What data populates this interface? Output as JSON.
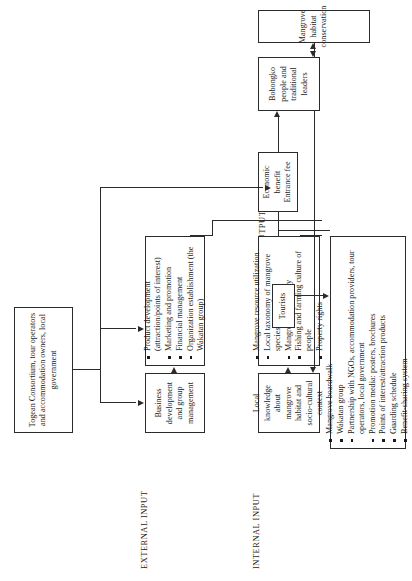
{
  "diagram": {
    "section_labels": {
      "external_input": "EXTERNAL INPUT",
      "internal_input": "INTERNAL INPUT",
      "output": "OUTPUT"
    },
    "nodes": {
      "consortium": {
        "name": "consortium-node",
        "text": "Togean Consortium, tour operators and accommodation owners, local government"
      },
      "business_development": {
        "name": "business-development-node",
        "text": "Business development and group management"
      },
      "external_activities": {
        "name": "external-activities-node",
        "items": [
          "Product development (attraction/points of interest)",
          "Marketing and promotion",
          "Financial management",
          "Organization establishment (the Wakatan group)"
        ]
      },
      "local_knowledge": {
        "name": "local-knowledge-node",
        "text": "Local knowledge about mangrove habitat and socio-cultural context"
      },
      "internal_resources": {
        "name": "internal-resources-node",
        "items": [
          "Mangrove resource utilization",
          "Local taxonomy of mangrove species",
          "Mangrove mythology",
          "Fishing and farming culture of people",
          "Property rights"
        ]
      },
      "outputs": {
        "name": "outputs-node",
        "items": [
          "Mangrove boardwalk",
          "Wakatan group",
          "Partnership with NGOs, accommodation providers, tour operators, local government",
          "Promotion media: posters, brochures",
          "Points of interest/attraction products",
          "Guarding schedule",
          "Benefit-sharing system"
        ]
      },
      "tourists": {
        "name": "tourists-node",
        "text": "Tourists"
      },
      "economic_benefit": {
        "name": "economic-benefit-node",
        "text": "Economic benefit Entrance fee"
      },
      "bobongko": {
        "name": "bobongko-node",
        "text": "Bobongko people and traditional leaders"
      },
      "conservation": {
        "name": "conservation-node",
        "text": "Mangrove habitat conservation"
      }
    },
    "colors": {
      "stroke": "#2b2b2b",
      "background": "#ffffff",
      "text": "#1a1a1a"
    }
  }
}
